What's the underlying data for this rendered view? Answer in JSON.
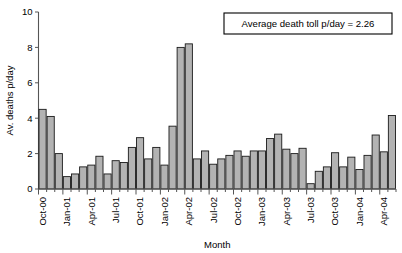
{
  "chart_data": {
    "type": "bar",
    "title": "",
    "xlabel": "Month",
    "ylabel": "Av. deaths p/day",
    "ylim": [
      0,
      10
    ],
    "yticks": [
      0,
      2,
      4,
      6,
      8,
      10
    ],
    "grid": false,
    "legend": "none",
    "bar_color": "#b3b3b3",
    "bar_edge_color": "#1a1a1a",
    "annotation": "Average death toll p/day = 2.26",
    "average_value": 2.26,
    "categories": [
      "Oct-00",
      "Nov-00",
      "Dec-00",
      "Jan-01",
      "Feb-01",
      "Mar-01",
      "Apr-01",
      "May-01",
      "Jun-01",
      "Jul-01",
      "Aug-01",
      "Sep-01",
      "Oct-01",
      "Nov-01",
      "Dec-01",
      "Jan-02",
      "Feb-02",
      "Mar-02",
      "Apr-02",
      "May-02",
      "Jun-02",
      "Jul-02",
      "Aug-02",
      "Sep-02",
      "Oct-02",
      "Nov-02",
      "Dec-02",
      "Jan-03",
      "Feb-03",
      "Mar-03",
      "Apr-03",
      "May-03",
      "Jun-03",
      "Jul-03",
      "Aug-03",
      "Sep-03",
      "Oct-03",
      "Nov-03",
      "Dec-03",
      "Jan-04",
      "Feb-04",
      "Mar-04",
      "Apr-04",
      "May-04"
    ],
    "values": [
      4.5,
      4.1,
      2.0,
      0.7,
      0.85,
      1.25,
      1.35,
      1.85,
      0.85,
      1.6,
      1.5,
      2.35,
      2.9,
      1.7,
      2.35,
      1.35,
      3.55,
      8.0,
      8.2,
      1.7,
      2.15,
      1.4,
      1.7,
      1.9,
      2.15,
      1.85,
      2.15,
      2.15,
      2.85,
      3.1,
      2.25,
      2.0,
      2.3,
      0.3,
      1.0,
      1.25,
      2.05,
      1.25,
      1.8,
      1.1,
      1.9,
      3.05,
      2.1,
      4.15
    ],
    "xtick_labels": [
      "Oct-00",
      "Jan-01",
      "Apr-01",
      "Jul-01",
      "Oct-01",
      "Jan-02",
      "Apr-02",
      "Jul-02",
      "Oct-02",
      "Jan-03",
      "Apr-03",
      "Jul-03",
      "Oct-03",
      "Jan-04",
      "Apr-04"
    ],
    "xtick_indices": [
      0,
      3,
      6,
      9,
      12,
      15,
      18,
      21,
      24,
      27,
      30,
      33,
      36,
      39,
      42
    ]
  }
}
